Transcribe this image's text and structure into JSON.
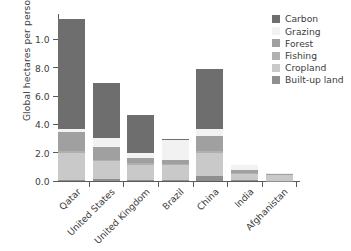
{
  "chart_data": {
    "type": "bar",
    "stacked": true,
    "title": "",
    "xlabel": "",
    "ylabel": "Global hectares per person",
    "ylim": [
      0.0,
      11.8
    ],
    "yticks": [
      0.0,
      2.0,
      4.0,
      6.0,
      8.0,
      10.0
    ],
    "ytick_labels": [
      "0.0",
      "2.0",
      "4.0",
      "6.0",
      "8.0",
      "1.0"
    ],
    "grid": false,
    "legend_position": "upper right",
    "categories": [
      "Qatar",
      "United States",
      "United Kingdom",
      "Brazil",
      "China",
      "India",
      "Afghanistan"
    ],
    "series": [
      {
        "name": "Built-up land",
        "color": "#8f8f8f",
        "values": [
          0.1,
          0.15,
          0.1,
          0.1,
          0.35,
          0.05,
          0.03
        ]
      },
      {
        "name": "Cropland",
        "color": "#c9c9c9",
        "values": [
          1.9,
          1.25,
          1.05,
          1.0,
          1.6,
          0.45,
          0.4
        ]
      },
      {
        "name": "Fishing",
        "color": "#b0b0b0",
        "values": [
          0.1,
          0.1,
          0.1,
          0.1,
          0.15,
          0.05,
          0.03
        ]
      },
      {
        "name": "Forest",
        "color": "#a0a0a0",
        "values": [
          1.35,
          0.9,
          0.35,
          0.3,
          1.1,
          0.25,
          0.04
        ]
      },
      {
        "name": "Grazing",
        "color": "#f2f2f2",
        "values": [
          0.25,
          0.65,
          0.4,
          1.4,
          0.45,
          0.3,
          0.1
        ]
      },
      {
        "name": "Carbon",
        "color": "#6e6e6e",
        "values": [
          7.75,
          3.9,
          2.65,
          0.05,
          4.3,
          0.0,
          0.0
        ]
      }
    ],
    "legend_order": [
      "Carbon",
      "Grazing",
      "Forest",
      "Fishing",
      "Cropland",
      "Built-up land"
    ],
    "totals": [
      11.45,
      6.95,
      4.65,
      2.95,
      7.95,
      1.1,
      0.6
    ]
  },
  "colors": {
    "axis": "#5a5a5a",
    "text": "#3d3d3d",
    "background": "#ffffff"
  }
}
